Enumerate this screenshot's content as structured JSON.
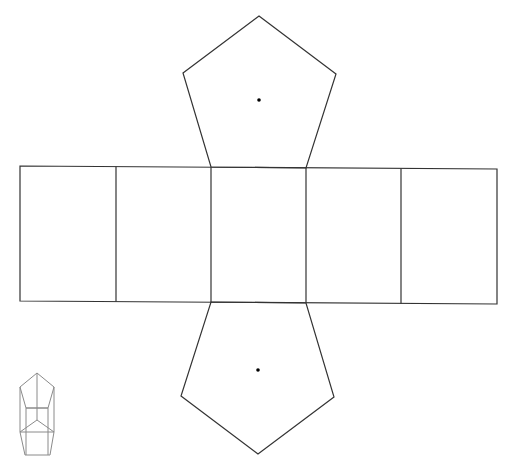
{
  "diagram": {
    "type": "net",
    "colors": {
      "stroke": "#333333",
      "icon_stroke": "#8a8a8a",
      "background": "#ffffff",
      "dot": "#000000"
    },
    "top_pentagon": {
      "points": [
        [
          259,
          16
        ],
        [
          336,
          74
        ],
        [
          306,
          168
        ],
        [
          211,
          167
        ],
        [
          183,
          73
        ]
      ],
      "center_dot": [
        259,
        100
      ]
    },
    "bottom_pentagon": {
      "points": [
        [
          211,
          302
        ],
        [
          306,
          303
        ],
        [
          334,
          397
        ],
        [
          258,
          454
        ],
        [
          181,
          396
        ]
      ],
      "center_dot": [
        258,
        370
      ]
    },
    "rectangle_strip": {
      "outline": [
        [
          20,
          166
        ],
        [
          497,
          169
        ],
        [
          497,
          304
        ],
        [
          20,
          301
        ]
      ],
      "dividers_x": [
        116,
        211,
        306,
        401
      ],
      "face_count": 5
    },
    "prism_icon": {
      "label": "pentagonal prism preview"
    }
  }
}
